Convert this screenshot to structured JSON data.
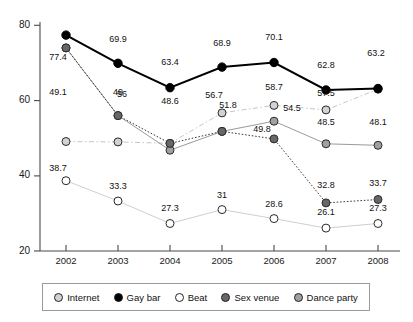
{
  "chart_data": {
    "type": "line",
    "title": "",
    "subtitle": "",
    "xlabel": "",
    "ylabel": "",
    "categories": [
      "2002",
      "2003",
      "2004",
      "2005",
      "2006",
      "2007",
      "2008"
    ],
    "x_tick_labels": [
      "2002",
      "2003",
      "2004",
      "2005",
      "2006",
      "2007",
      "2008"
    ],
    "y_tick_labels": [
      "20",
      "40",
      "60",
      "80"
    ],
    "y_ticks": [
      20,
      40,
      60,
      80
    ],
    "ylim": [
      20,
      80
    ],
    "grid": false,
    "legend_position": "bottom",
    "series": [
      {
        "name": "Internet",
        "color": "#d2d2d2",
        "line_style": "dash-dot",
        "values": [
          49.1,
          49,
          48.6,
          56.7,
          58.7,
          57.5,
          63.0
        ],
        "labels": [
          "49.1",
          "49",
          "48.6",
          "56.7",
          "58.7",
          "57.5",
          ""
        ]
      },
      {
        "name": "Gay bar",
        "color": "#000000",
        "line_style": "solid",
        "values": [
          77.4,
          69.9,
          63.4,
          68.9,
          70.1,
          62.8,
          63.2
        ],
        "labels": [
          "77.4",
          "69.9",
          "63.4",
          "68.9",
          "70.1",
          "62.8",
          "63.2"
        ]
      },
      {
        "name": "Beat",
        "color": "#ffffff",
        "line_style": "solid",
        "values": [
          38.7,
          33.3,
          27.3,
          31,
          28.6,
          26.1,
          27.3
        ],
        "labels": [
          "38.7",
          "33.3",
          "27.3",
          "31",
          "28.6",
          "26.1",
          "27.3"
        ]
      },
      {
        "name": "Sex venue",
        "color": "#676767",
        "line_style": "dotted",
        "values": [
          74.0,
          56,
          48.6,
          51.8,
          49.8,
          32.8,
          33.7
        ],
        "labels": [
          "",
          "56",
          "48.6",
          "51.8",
          "49.8",
          "32.8",
          "33.7"
        ]
      },
      {
        "name": "Dance party",
        "color": "#a0a0a0",
        "line_style": "solid",
        "values": [
          74.0,
          56.0,
          46.8,
          51.8,
          54.5,
          48.5,
          48.1
        ],
        "labels": [
          "",
          "",
          "",
          "",
          "54.5",
          "48.5",
          "48.1"
        ]
      }
    ],
    "annotations": [
      {
        "text": "77.4",
        "series": "Gay bar",
        "category": "2002"
      },
      {
        "text": "69.9",
        "series": "Gay bar",
        "category": "2003"
      },
      {
        "text": "63.4",
        "series": "Gay bar",
        "category": "2004"
      },
      {
        "text": "68.9",
        "series": "Gay bar",
        "category": "2005"
      },
      {
        "text": "70.1",
        "series": "Gay bar",
        "category": "2006"
      },
      {
        "text": "62.8",
        "series": "Gay bar",
        "category": "2007"
      },
      {
        "text": "63.2",
        "series": "Gay bar",
        "category": "2008"
      },
      {
        "text": "49.1",
        "series": "Internet",
        "category": "2002"
      },
      {
        "text": "49",
        "series": "Internet",
        "category": "2003"
      },
      {
        "text": "56.7",
        "series": "Internet",
        "category": "2005"
      },
      {
        "text": "58.7",
        "series": "Internet",
        "category": "2006"
      },
      {
        "text": "57.5",
        "series": "Internet",
        "category": "2007"
      },
      {
        "text": "56",
        "series": "Sex venue",
        "category": "2003"
      },
      {
        "text": "48.6",
        "series": "Sex venue",
        "category": "2004"
      },
      {
        "text": "51.8",
        "series": "Sex venue",
        "category": "2005"
      },
      {
        "text": "49.8",
        "series": "Sex venue",
        "category": "2006"
      },
      {
        "text": "32.8",
        "series": "Sex venue",
        "category": "2007"
      },
      {
        "text": "33.7",
        "series": "Sex venue",
        "category": "2008"
      },
      {
        "text": "54.5",
        "series": "Dance party",
        "category": "2006"
      },
      {
        "text": "48.5",
        "series": "Dance party",
        "category": "2007"
      },
      {
        "text": "48.1",
        "series": "Dance party",
        "category": "2008"
      },
      {
        "text": "38.7",
        "series": "Beat",
        "category": "2002"
      },
      {
        "text": "33.3",
        "series": "Beat",
        "category": "2003"
      },
      {
        "text": "27.3",
        "series": "Beat",
        "category": "2004"
      },
      {
        "text": "31",
        "series": "Beat",
        "category": "2005"
      },
      {
        "text": "28.6",
        "series": "Beat",
        "category": "2006"
      },
      {
        "text": "26.1",
        "series": "Beat",
        "category": "2007"
      },
      {
        "text": "27.3",
        "series": "Beat",
        "category": "2008"
      }
    ]
  },
  "axis": {
    "y": {
      "t0": "80",
      "t1": "60",
      "t2": "40",
      "t3": "20"
    },
    "x": {
      "t0": "2002",
      "t1": "2003",
      "t2": "2004",
      "t3": "2005",
      "t4": "2006",
      "t5": "2007",
      "t6": "2008"
    }
  },
  "legend": {
    "items": [
      {
        "label": "Internet",
        "color": "#d2d2d2"
      },
      {
        "label": "Gay bar",
        "color": "#000000"
      },
      {
        "label": "Beat",
        "color": "#ffffff"
      },
      {
        "label": "Sex venue",
        "color": "#676767"
      },
      {
        "label": "Dance party",
        "color": "#a0a0a0"
      }
    ]
  },
  "labels": {
    "internet": {
      "y2002": "49.1",
      "y2003": "49",
      "y2004": "",
      "y2005": "56.7",
      "y2006": "58.7",
      "y2007": "57.5",
      "y2008": ""
    },
    "gaybar": {
      "y2002": "77.4",
      "y2003": "69.9",
      "y2004": "63.4",
      "y2005": "68.9",
      "y2006": "70.1",
      "y2007": "62.8",
      "y2008": "63.2"
    },
    "beat": {
      "y2002": "38.7",
      "y2003": "33.3",
      "y2004": "27.3",
      "y2005": "31",
      "y2006": "28.6",
      "y2007": "26.1",
      "y2008": "27.3"
    },
    "sexvenue": {
      "y2003": "56",
      "y2004": "48.6",
      "y2005": "51.8",
      "y2006": "49.8",
      "y2007": "32.8",
      "y2008": "33.7"
    },
    "danceparty": {
      "y2006": "54.5",
      "y2007": "48.5",
      "y2008": "48.1"
    }
  }
}
